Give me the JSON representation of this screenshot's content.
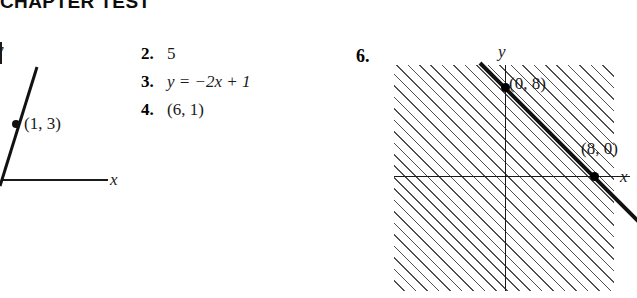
{
  "heading": {
    "title": "CHAPTER TEST"
  },
  "answers": {
    "items": [
      {
        "number": "2.",
        "value": "5"
      },
      {
        "number": "3.",
        "value": "y = −2x + 1"
      },
      {
        "number": "4.",
        "value": "(6, 1)"
      }
    ]
  },
  "graph_left": {
    "axis_x_label": "x",
    "axis_y_label": "y",
    "point_label": "(1, 3)"
  },
  "graph_right": {
    "number": "6.",
    "axis_x_label": "x",
    "axis_y_label": "y",
    "point_labels": [
      "(0, 8)",
      "(8, 0)"
    ]
  },
  "colors": {
    "ink": "#1a1a1a",
    "hatch": "#464646",
    "background": "#ffffff"
  }
}
